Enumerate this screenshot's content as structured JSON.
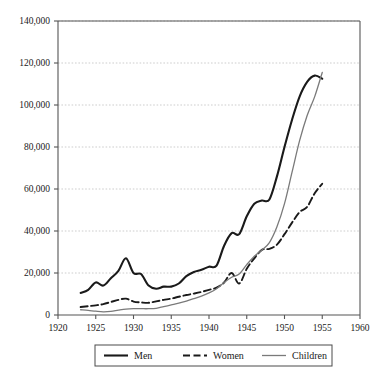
{
  "chart_data": {
    "type": "line",
    "title": "",
    "subtitle": "",
    "xlabel": "",
    "ylabel": "",
    "xlim": [
      1920,
      1960
    ],
    "ylim": [
      0,
      140000
    ],
    "grid": true,
    "grid_axis": "y",
    "legend_position": "bottom",
    "x_ticks": [
      "1920",
      "1925",
      "1930",
      "1935",
      "1940",
      "1945",
      "1950",
      "1955",
      "1960"
    ],
    "y_ticks": [
      "0",
      "20,000",
      "40,000",
      "60,000",
      "80,000",
      "100,000",
      "120,000",
      "140,000"
    ],
    "x": [
      1923,
      1924,
      1925,
      1926,
      1927,
      1928,
      1929,
      1930,
      1931,
      1932,
      1933,
      1934,
      1935,
      1936,
      1937,
      1938,
      1939,
      1940,
      1941,
      1942,
      1943,
      1944,
      1945,
      1946,
      1947,
      1948,
      1949,
      1950,
      1951,
      1952,
      1953,
      1954,
      1955
    ],
    "series": [
      {
        "name": "Men",
        "color": "#1a1a1a",
        "style": "solid",
        "width": 2.1,
        "values": [
          10500,
          12000,
          15500,
          14000,
          17500,
          21000,
          27000,
          20000,
          19500,
          14000,
          12500,
          13500,
          13500,
          15000,
          18500,
          20500,
          21500,
          23000,
          23500,
          33000,
          39000,
          38500,
          47000,
          53000,
          54500,
          55000,
          66000,
          80000,
          93000,
          104000,
          111000,
          114000,
          112500
        ]
      },
      {
        "name": "Women",
        "color": "#1a1a1a",
        "style": "dashed",
        "width": 1.9,
        "values": [
          3800,
          4200,
          4600,
          5200,
          6200,
          7200,
          7800,
          6400,
          6000,
          5800,
          6500,
          7200,
          7800,
          8700,
          9500,
          10200,
          11000,
          12000,
          13000,
          15500,
          20000,
          15000,
          22000,
          27000,
          31000,
          31500,
          33500,
          38500,
          44000,
          49000,
          51500,
          58000,
          62500
        ]
      },
      {
        "name": "Children",
        "color": "#7a7a7a",
        "style": "solid",
        "width": 1.3,
        "values": [
          2500,
          2200,
          1800,
          1500,
          1700,
          2300,
          2800,
          3000,
          3000,
          3000,
          3200,
          4000,
          4800,
          5600,
          6600,
          7800,
          9000,
          10500,
          12500,
          15500,
          18000,
          19500,
          24000,
          28000,
          31000,
          34500,
          42000,
          53000,
          68000,
          83000,
          95000,
          104000,
          115500
        ]
      }
    ],
    "legend": [
      {
        "label": "Men",
        "color": "#1a1a1a",
        "style": "solid",
        "width": 2.1
      },
      {
        "label": "Women",
        "color": "#1a1a1a",
        "style": "dashed",
        "width": 1.9
      },
      {
        "label": "Children",
        "color": "#7a7a7a",
        "style": "solid",
        "width": 1.3
      }
    ],
    "axis_color": "#555555",
    "grid_color": "#b8b8b8",
    "background": "#ffffff"
  }
}
